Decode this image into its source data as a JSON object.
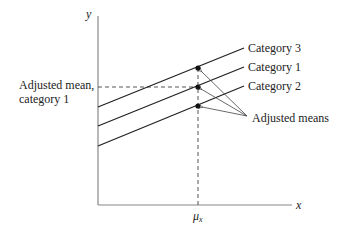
{
  "axes": {
    "y_label": "y",
    "x_label": "x",
    "x_tick_label": "μ",
    "x_tick_sub": "x"
  },
  "left_label": {
    "line1": "Adjusted mean,",
    "line2": "category 1"
  },
  "lines": [
    {
      "name": "Category 3",
      "x1": 98,
      "y1": 107,
      "x2": 244,
      "y2": 48
    },
    {
      "name": "Category 1",
      "x1": 98,
      "y1": 126,
      "x2": 244,
      "y2": 67
    },
    {
      "name": "Category 2",
      "x1": 98,
      "y1": 146,
      "x2": 244,
      "y2": 86
    }
  ],
  "points": [
    {
      "category": "Category 3",
      "x": 198,
      "y": 68
    },
    {
      "category": "Category 1",
      "x": 198,
      "y": 87
    },
    {
      "category": "Category 2",
      "x": 198,
      "y": 106
    }
  ],
  "annotation": {
    "label": "Adjusted means",
    "origin": {
      "x": 247,
      "y": 116
    }
  },
  "colors": {
    "line": "#222222",
    "axis": "#888888"
  }
}
